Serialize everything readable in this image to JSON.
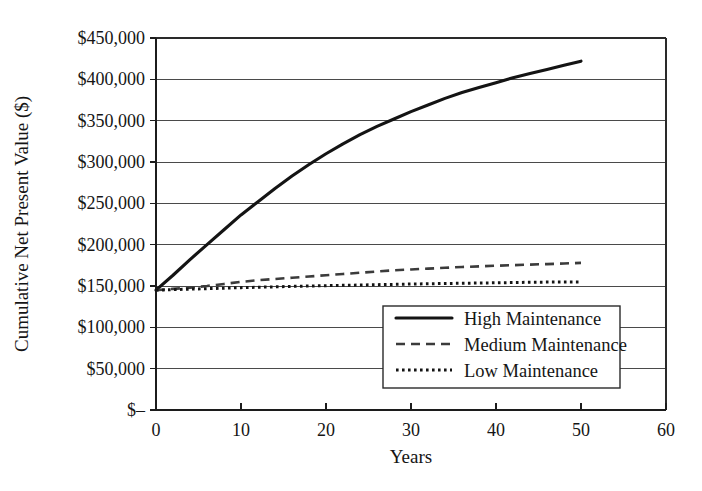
{
  "chart_data": {
    "type": "line",
    "title": "",
    "xlabel": "Years",
    "ylabel": "Cumulative Net Present Value ($)",
    "xlim": [
      0,
      60
    ],
    "ylim": [
      0,
      450000
    ],
    "grid": true,
    "legend_position": "inside-bottom-right",
    "x_ticks": [
      "0",
      "10",
      "20",
      "30",
      "40",
      "50",
      "60"
    ],
    "x_tick_values": [
      0,
      10,
      20,
      30,
      40,
      50,
      60
    ],
    "y_ticks": [
      "$–",
      "$50,000",
      "$100,000",
      "$150,000",
      "$200,000",
      "$250,000",
      "$300,000",
      "$350,000",
      "$400,000",
      "$450,000"
    ],
    "y_tick_values": [
      0,
      50000,
      100000,
      150000,
      200000,
      250000,
      300000,
      350000,
      400000,
      450000
    ],
    "x": [
      0,
      2,
      4,
      6,
      8,
      10,
      12,
      14,
      16,
      18,
      20,
      22,
      24,
      26,
      28,
      30,
      32,
      34,
      36,
      38,
      40,
      42,
      44,
      46,
      48,
      50
    ],
    "series": [
      {
        "name": "High Maintenance",
        "style": "solid",
        "color": "#141414",
        "values": [
          145000,
          163000,
          182000,
          200000,
          218000,
          236000,
          252000,
          268000,
          283000,
          297000,
          310000,
          322000,
          333000,
          343000,
          352000,
          361000,
          369000,
          377000,
          384000,
          390000,
          396000,
          402000,
          407000,
          412000,
          417000,
          422000
        ]
      },
      {
        "name": "Medium Maintenance",
        "style": "dashed",
        "color": "#3b3b3b",
        "values": [
          145000,
          146500,
          148000,
          150000,
          152500,
          155000,
          157000,
          158500,
          160000,
          161500,
          163000,
          164500,
          166000,
          167500,
          169000,
          170000,
          171000,
          172000,
          173000,
          173800,
          174500,
          175200,
          175900,
          176500,
          177200,
          178000
        ]
      },
      {
        "name": "Low Maintenance",
        "style": "dotted",
        "color": "#141414",
        "values": [
          145000,
          145600,
          146200,
          146800,
          147400,
          148000,
          148500,
          149000,
          149500,
          150000,
          150400,
          150800,
          151200,
          151600,
          152000,
          152400,
          152700,
          153000,
          153300,
          153600,
          153900,
          154200,
          154500,
          154700,
          154900,
          155000
        ]
      }
    ]
  },
  "legend": {
    "items": [
      {
        "label": "High Maintenance",
        "style": "solid"
      },
      {
        "label": "Medium Maintenance",
        "style": "dashed"
      },
      {
        "label": "Low Maintenance",
        "style": "dotted"
      }
    ]
  },
  "colors": {
    "background": "#ffffff",
    "ink": "#151515",
    "gridline": "#4a4a4a",
    "axis": "#1c1c1c"
  }
}
